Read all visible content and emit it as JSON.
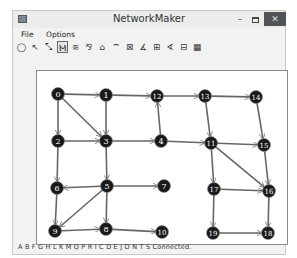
{
  "window": {
    "title": "NetworkMaker",
    "minimize_label": "–",
    "close_label": "✕"
  },
  "menu": {
    "items": [
      {
        "label": "File"
      },
      {
        "label": "Options"
      }
    ]
  },
  "toolbar": {
    "tools": [
      {
        "name": "add-node-tool",
        "glyph": "◯"
      },
      {
        "name": "add-link-tool",
        "glyph": "↖"
      },
      {
        "name": "add-two-way-link-tool",
        "glyph": "⤡"
      },
      {
        "name": "path-tool",
        "glyph": "Ⲙ",
        "active": true
      },
      {
        "name": "tree-tool",
        "glyph": "≋"
      },
      {
        "name": "spanning-tree-tool",
        "glyph": "⅋"
      },
      {
        "name": "shortest-path-tool",
        "glyph": "⌂"
      },
      {
        "name": "path-tree-tool",
        "glyph": "⌔"
      },
      {
        "name": "connectivity-tool",
        "glyph": "⊠"
      },
      {
        "name": "label-tool-1",
        "glyph": "∡"
      },
      {
        "name": "label-tool-2",
        "glyph": "⊞"
      },
      {
        "name": "label-tool-3",
        "glyph": "∢"
      },
      {
        "name": "label-tool-4",
        "glyph": "⊟"
      },
      {
        "name": "grid-tool",
        "glyph": "▦"
      }
    ]
  },
  "network": {
    "node_color": "#1a1a1a",
    "node_text_color": "#ffffff",
    "edge_color": "#666666",
    "nodes": [
      {
        "id": "0",
        "x": 21,
        "y": 23
      },
      {
        "id": "1",
        "x": 69,
        "y": 24
      },
      {
        "id": "2",
        "x": 21,
        "y": 70
      },
      {
        "id": "3",
        "x": 69,
        "y": 70
      },
      {
        "id": "4",
        "x": 124,
        "y": 70
      },
      {
        "id": "5",
        "x": 70,
        "y": 115
      },
      {
        "id": "6",
        "x": 20,
        "y": 117
      },
      {
        "id": "7",
        "x": 127,
        "y": 115
      },
      {
        "id": "8",
        "x": 69,
        "y": 158
      },
      {
        "id": "9",
        "x": 18,
        "y": 160
      },
      {
        "id": "10",
        "x": 125,
        "y": 161
      },
      {
        "id": "11",
        "x": 174,
        "y": 72
      },
      {
        "id": "12",
        "x": 120,
        "y": 25
      },
      {
        "id": "13",
        "x": 168,
        "y": 25
      },
      {
        "id": "14",
        "x": 219,
        "y": 26
      },
      {
        "id": "15",
        "x": 227,
        "y": 74
      },
      {
        "id": "16",
        "x": 232,
        "y": 120
      },
      {
        "id": "17",
        "x": 177,
        "y": 118
      },
      {
        "id": "18",
        "x": 231,
        "y": 162
      },
      {
        "id": "19",
        "x": 176,
        "y": 162
      }
    ],
    "edges": [
      [
        "0",
        "1"
      ],
      [
        "0",
        "2"
      ],
      [
        "0",
        "3"
      ],
      [
        "1",
        "3"
      ],
      [
        "1",
        "12"
      ],
      [
        "2",
        "3"
      ],
      [
        "2",
        "6"
      ],
      [
        "3",
        "4"
      ],
      [
        "3",
        "5"
      ],
      [
        "4",
        "11"
      ],
      [
        "4",
        "12"
      ],
      [
        "12",
        "13"
      ],
      [
        "13",
        "14"
      ],
      [
        "13",
        "11"
      ],
      [
        "14",
        "15"
      ],
      [
        "11",
        "15"
      ],
      [
        "11",
        "17"
      ],
      [
        "11",
        "16"
      ],
      [
        "15",
        "16"
      ],
      [
        "17",
        "16"
      ],
      [
        "17",
        "19"
      ],
      [
        "16",
        "18"
      ],
      [
        "19",
        "18"
      ],
      [
        "5",
        "6"
      ],
      [
        "5",
        "7"
      ],
      [
        "5",
        "9"
      ],
      [
        "5",
        "8"
      ],
      [
        "6",
        "9"
      ],
      [
        "9",
        "8"
      ],
      [
        "8",
        "10"
      ]
    ]
  },
  "status": {
    "text": "A B F G H L K M Q P R I C D E J O N T S Connected."
  }
}
